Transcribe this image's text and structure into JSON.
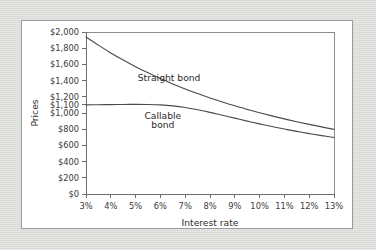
{
  "figure": {
    "panel_background": "#ffffff",
    "outer_background": "#dcdcda",
    "border_color": "#9a9a98"
  },
  "chart_data": {
    "type": "line",
    "title": "",
    "subtitle": "",
    "xlabel": "Interest rate",
    "ylabel": "Prices",
    "xlim": [
      3,
      13
    ],
    "ylim": [
      0,
      2000
    ],
    "grid": false,
    "legend_position": "inline-annotations",
    "x_tick_labels": [
      "3%",
      "4%",
      "5%",
      "6%",
      "7%",
      "8%",
      "9%",
      "10%",
      "11%",
      "12%",
      "13%"
    ],
    "x_tick_values": [
      3,
      4,
      5,
      6,
      7,
      8,
      9,
      10,
      11,
      12,
      13
    ],
    "y_tick_labels": [
      "$0",
      "$200",
      "$400",
      "$600",
      "$800",
      "$1,000",
      "$1,100",
      "$1,200",
      "$1,400",
      "$1,600",
      "$1,800",
      "$2,000"
    ],
    "y_tick_values": [
      0,
      200,
      400,
      600,
      800,
      1000,
      1100,
      1200,
      1400,
      1600,
      1800,
      2000
    ],
    "x": [
      3,
      3.5,
      4,
      4.5,
      5,
      5.5,
      6,
      6.5,
      7,
      7.5,
      8,
      8.5,
      9,
      9.5,
      10,
      10.5,
      11,
      11.5,
      12,
      12.5,
      13
    ],
    "series": [
      {
        "name": "Straight bond",
        "label": "Straight bond",
        "color": "#4a4a4a",
        "values": [
          1940,
          1838,
          1742,
          1654,
          1572,
          1496,
          1425,
          1359,
          1297,
          1240,
          1186,
          1136,
          1089,
          1045,
          1003,
          964,
          927,
          892,
          859,
          828,
          798
        ]
      },
      {
        "name": "Callable bond",
        "label": "Callable bond",
        "color": "#4a4a4a",
        "values": [
          1100,
          1102,
          1104,
          1105,
          1106,
          1105,
          1100,
          1088,
          1068,
          1040,
          1008,
          972,
          936,
          900,
          866,
          833,
          802,
          773,
          746,
          721,
          698
        ]
      }
    ],
    "annotations": [
      {
        "name": "straight-bond-label",
        "text": "Straight bond",
        "x": 6.35,
        "y": 1390
      },
      {
        "name": "callable-bond-label-line1",
        "text": "Callable",
        "x": 6.1,
        "y": 930
      },
      {
        "name": "callable-bond-label-line2",
        "text": "bond",
        "x": 6.1,
        "y": 820
      }
    ]
  }
}
